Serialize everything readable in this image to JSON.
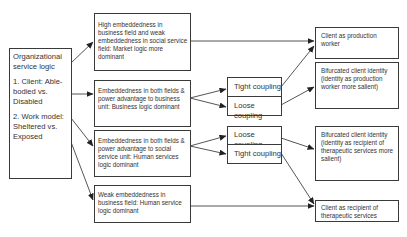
{
  "diagram": {
    "source": {
      "title": "Organizational service logic",
      "items": [
        "1. Client: Able-bodied vs. Disabled",
        "2. Work model: Sheltered vs. Exposed"
      ]
    },
    "conditions": [
      {
        "id": "c1",
        "text": "High embeddedness in business field and weak embeddedness in social service field: Market logic more dominant"
      },
      {
        "id": "c2",
        "text": "Embeddedness in both fields & power advantage to business unit:  Business logic dominant"
      },
      {
        "id": "c3",
        "text": "Embeddedness in both fields & power advantage to social service unit: Human services logic dominant"
      },
      {
        "id": "c4",
        "text": "Weak embeddedness in business field: Human service logic dominant"
      }
    ],
    "couplings": [
      {
        "group": "c2",
        "top": "Tight coupling",
        "bottom": "Loose coupling"
      },
      {
        "group": "c3",
        "top": "Loose coupling",
        "bottom": "Tight coupling"
      }
    ],
    "outcomes": [
      {
        "id": "o1",
        "text": "Client as production worker"
      },
      {
        "id": "o2",
        "text": "Bifurcated client identity (identity as production worker more salient)"
      },
      {
        "id": "o3",
        "text": "Bifurcated client identity (identity as recipient of therapeutic services more salient)"
      },
      {
        "id": "o4",
        "text": "Client as recipient of therapeutic services"
      }
    ],
    "edges": [
      [
        "source",
        "c1"
      ],
      [
        "source",
        "c2"
      ],
      [
        "source",
        "c3"
      ],
      [
        "source",
        "c4"
      ],
      [
        "c1",
        "o1"
      ],
      [
        "c2",
        "Tight coupling"
      ],
      [
        "c2",
        "Loose coupling"
      ],
      [
        "c3",
        "Loose coupling"
      ],
      [
        "c3",
        "Tight coupling"
      ],
      [
        "c2:Tight coupling",
        "o1"
      ],
      [
        "c2:Loose coupling",
        "o2"
      ],
      [
        "c3:Loose coupling",
        "o3"
      ],
      [
        "c3:Tight coupling",
        "o4"
      ],
      [
        "c4",
        "o4"
      ]
    ],
    "colors": {
      "line": "#2a2a2a",
      "text": "#333333",
      "background": "#ffffff"
    }
  }
}
